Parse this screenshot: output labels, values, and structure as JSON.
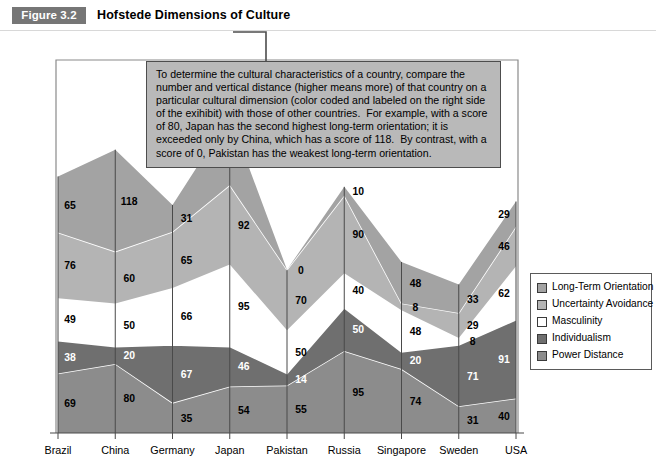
{
  "header": {
    "figure_badge": "Figure 3.2",
    "title": "Hofstede Dimensions of Culture"
  },
  "callout": {
    "text": "To determine the cultural characteristics of a country, compare the number and vertical distance (higher means more) of that country on a particular cultural dimension (color coded and labeled on the right side of the exihibit) with those of other countries.  For example, with a score of 80, Japan has the second highest long-term orientation; it is exceeded only by China, which has a score of 118.  By contrast, with a score of 0, Pakistan has the weakest long-term orientation."
  },
  "legend": {
    "position": "right",
    "items": [
      {
        "label": "Long-Term Orientation",
        "color": "#a3a3a3"
      },
      {
        "label": "Uncertainty Avoidance",
        "color": "#b4b4b4"
      },
      {
        "label": "Masculinity",
        "color": "#ffffff"
      },
      {
        "label": "Individualism",
        "color": "#6f6f6f"
      },
      {
        "label": "Power Distance",
        "color": "#8c8c8c"
      }
    ]
  },
  "chart_data": {
    "type": "area",
    "title": "Hofstede Dimensions of Culture",
    "xlabel": "",
    "ylabel": "",
    "stacked": true,
    "grid": false,
    "axis_note": "vertical reference line at each country; values are stacked bottom-to-top: Power Distance, Individualism, Masculinity, Uncertainty Avoidance, Long-Term Orientation",
    "categories": [
      "Brazil",
      "China",
      "Germany",
      "Japan",
      "Pakistan",
      "Russia",
      "Singapore",
      "Sweden",
      "USA"
    ],
    "series": [
      {
        "name": "Power Distance",
        "color": "#8c8c8c",
        "values": [
          69,
          80,
          35,
          54,
          55,
          95,
          74,
          31,
          40
        ]
      },
      {
        "name": "Individualism",
        "color": "#6f6f6f",
        "values": [
          38,
          20,
          67,
          46,
          14,
          50,
          20,
          71,
          91
        ]
      },
      {
        "name": "Masculinity",
        "color": "#ffffff",
        "values": [
          49,
          50,
          66,
          95,
          50,
          40,
          48,
          8,
          62
        ]
      },
      {
        "name": "Uncertainty Avoidance",
        "color": "#b4b4b4",
        "values": [
          76,
          60,
          65,
          92,
          70,
          90,
          8,
          29,
          46
        ]
      },
      {
        "name": "Long-Term Orientation",
        "color": "#a3a3a3",
        "values": [
          65,
          118,
          31,
          80,
          0,
          10,
          48,
          33,
          29
        ]
      }
    ]
  }
}
